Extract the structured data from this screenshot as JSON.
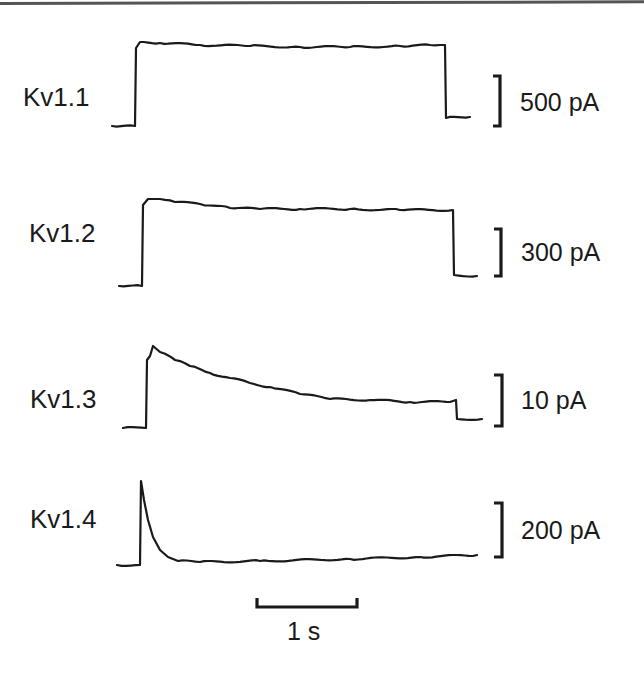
{
  "chart_data": {
    "type": "line",
    "title": "",
    "xlabel": "Time",
    "ylabel": "Current",
    "grid": false,
    "legend": "none",
    "time_scale_bar": {
      "value": 1,
      "unit": "s",
      "label": "1 s"
    },
    "series": [
      {
        "name": "Kv1.1",
        "scale_bar_label": "500 pA",
        "scale_bar_value": 500,
        "shape": "non-inactivating step",
        "points_px": [
          [
            112,
            126
          ],
          [
            135,
            126
          ],
          [
            136,
            48
          ],
          [
            140,
            42
          ],
          [
            160,
            43
          ],
          [
            200,
            45
          ],
          [
            250,
            46
          ],
          [
            300,
            47
          ],
          [
            350,
            47
          ],
          [
            400,
            46
          ],
          [
            430,
            45
          ],
          [
            445,
            45
          ],
          [
            446,
            118
          ],
          [
            470,
            117
          ]
        ]
      },
      {
        "name": "Kv1.2",
        "scale_bar_label": "300 pA",
        "scale_bar_value": 300,
        "shape": "slow activation, minimal inactivation",
        "points_px": [
          [
            119,
            286
          ],
          [
            142,
            286
          ],
          [
            143,
            205
          ],
          [
            148,
            199
          ],
          [
            160,
            199
          ],
          [
            175,
            202
          ],
          [
            200,
            204
          ],
          [
            230,
            208
          ],
          [
            260,
            209
          ],
          [
            300,
            209
          ],
          [
            350,
            209
          ],
          [
            400,
            210
          ],
          [
            453,
            210
          ],
          [
            454,
            275
          ],
          [
            477,
            276
          ]
        ]
      },
      {
        "name": "Kv1.3",
        "scale_bar_label": "10 pA",
        "scale_bar_value": 10,
        "shape": "slow C-type inactivation",
        "points_px": [
          [
            123,
            428
          ],
          [
            146,
            428
          ],
          [
            147,
            360
          ],
          [
            150,
            356
          ],
          [
            153,
            346
          ],
          [
            160,
            352
          ],
          [
            175,
            360
          ],
          [
            190,
            366
          ],
          [
            210,
            373
          ],
          [
            230,
            378
          ],
          [
            250,
            383
          ],
          [
            270,
            387
          ],
          [
            300,
            394
          ],
          [
            330,
            399
          ],
          [
            370,
            400
          ],
          [
            410,
            402
          ],
          [
            450,
            402
          ],
          [
            456,
            400
          ],
          [
            457,
            419
          ],
          [
            482,
            419
          ]
        ]
      },
      {
        "name": "Kv1.4",
        "scale_bar_label": "200 pA",
        "scale_bar_value": 200,
        "shape": "fast N-type inactivation (A-type)",
        "points_px": [
          [
            117,
            565
          ],
          [
            140,
            565
          ],
          [
            141,
            481
          ],
          [
            144,
            500
          ],
          [
            148,
            520
          ],
          [
            153,
            537
          ],
          [
            160,
            550
          ],
          [
            168,
            557
          ],
          [
            178,
            561
          ],
          [
            200,
            562
          ],
          [
            260,
            561
          ],
          [
            350,
            559
          ],
          [
            420,
            557
          ],
          [
            477,
            555
          ]
        ]
      }
    ]
  },
  "labels": {
    "kv11": "Kv1.1",
    "kv12": "Kv1.2",
    "kv13": "Kv1.3",
    "kv14": "Kv1.4"
  },
  "scale_labels": {
    "kv11": "500 pA",
    "kv12": "300 pA",
    "kv13": "10 pA",
    "kv14": "200 pA",
    "time": "1 s"
  },
  "colors": {
    "trace": "#1a1a1a",
    "background": "#ffffff"
  }
}
